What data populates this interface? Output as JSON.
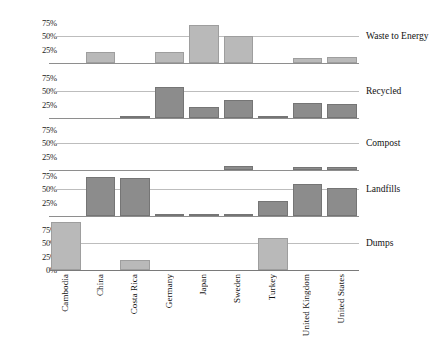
{
  "chart_data": {
    "type": "bar",
    "title": "",
    "subtitle": "",
    "xlabel": "",
    "ylabel": "",
    "ylim": [
      0,
      100
    ],
    "grid": true,
    "legend_position": "right-panel-labels",
    "categories": [
      "Cambodia",
      "China",
      "Costa Rica",
      "Germany",
      "Japan",
      "Sweden",
      "Turkey",
      "United Kingdom",
      "United States"
    ],
    "y_ticks": [
      "75%",
      "50%",
      "25%",
      "0%"
    ],
    "y_tick_values": [
      75,
      50,
      25,
      0
    ],
    "panel_order": [
      "Waste to Energy",
      "Recycled",
      "Compost",
      "Landfills",
      "Dumps"
    ],
    "series": [
      {
        "name": "Waste to Energy",
        "color": "#b9b9b9",
        "values": [
          0,
          21,
          0,
          20,
          71,
          50,
          0,
          9,
          12
        ]
      },
      {
        "name": "Recycled",
        "color": "#8c8c8c",
        "values": [
          0,
          0,
          2,
          57,
          20,
          33,
          1,
          27,
          26
        ]
      },
      {
        "name": "Compost",
        "color": "#8c8c8c",
        "values": [
          0,
          0,
          0,
          0,
          0,
          8,
          0,
          6,
          6
        ]
      },
      {
        "name": "Landfills",
        "color": "#8c8c8c",
        "values": [
          0,
          72,
          71,
          1,
          2,
          3,
          28,
          59,
          51
        ]
      },
      {
        "name": "Dumps",
        "color": "#b9b9b9",
        "values": [
          88,
          0,
          19,
          0,
          0,
          0,
          60,
          0,
          0
        ]
      }
    ]
  },
  "panels": [
    {
      "label": "Waste to Energy",
      "ticks": [
        "75%",
        "50%",
        "25%"
      ],
      "tick_values": [
        75,
        50,
        25
      ]
    },
    {
      "label": "Recycled",
      "ticks": [
        "75%",
        "50%",
        "25%"
      ],
      "tick_values": [
        75,
        50,
        25
      ]
    },
    {
      "label": "Compost",
      "ticks": [
        "75%",
        "50%",
        "25%"
      ],
      "tick_values": [
        75,
        50,
        25
      ]
    },
    {
      "label": "Landfills",
      "ticks": [
        "75%",
        "50%",
        "25%"
      ],
      "tick_values": [
        75,
        50,
        25
      ]
    },
    {
      "label": "Dumps",
      "ticks": [
        "75%",
        "50%",
        "25%",
        "0%"
      ],
      "tick_values": [
        75,
        50,
        25,
        0
      ]
    }
  ]
}
